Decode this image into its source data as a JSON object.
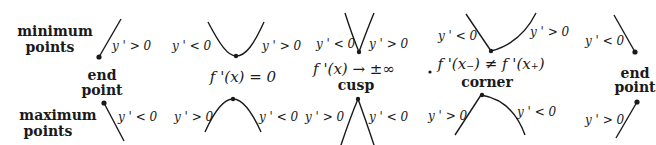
{
  "row_labels": {
    "minimum_line1": "minimum",
    "minimum_line2": "points",
    "maximum_line1": "maximum",
    "maximum_line2": "points"
  },
  "cases": {
    "endpoint_left": {
      "label_line1": "end",
      "label_line2": "point",
      "min_slope": "y ' > 0",
      "max_slope": "y ' < 0"
    },
    "smooth": {
      "condition": "f '(x) = 0",
      "min_left": "y ' < 0",
      "min_right": "y ' > 0",
      "max_left": "y ' > 0",
      "max_right": "y ' < 0"
    },
    "cusp": {
      "condition": "f '(x) → ±∞",
      "label": "cusp",
      "min_left": "y ' < 0",
      "min_right": "y ' > 0",
      "max_left": "y ' > 0",
      "max_right": "y ' < 0"
    },
    "corner": {
      "condition": "f '(x₋) ≠ f '(x₊)",
      "label": "corner",
      "min_left": "y ' < 0",
      "min_right": "y ' > 0",
      "max_left": "y ' > 0",
      "max_right": "y ' < 0"
    },
    "endpoint_right": {
      "label_line1": "end",
      "label_line2": "point",
      "min_slope": "y ' < 0",
      "max_slope": "y ' > 0"
    }
  }
}
